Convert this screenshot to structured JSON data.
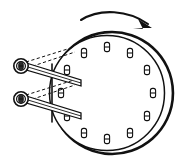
{
  "figure": {
    "title": "Rotating drum with bolted rim and twin pivoting link rods",
    "background_color": "#ffffff",
    "line_color": "#111111",
    "width": 175,
    "height": 162
  },
  "rotation_arrow": {
    "name": "rotation-direction-arrow",
    "direction": "clockwise",
    "label": "",
    "position": "above drum, sweeping left to right"
  },
  "drum": {
    "name": "drum-wheel",
    "center_x": 107,
    "center_y": 93,
    "radius": 61,
    "rim_thickness": 4,
    "bolt_count": 12,
    "bolt_circle_radius": 46,
    "bolt_label": "",
    "bolts": [
      {
        "index": 1,
        "angle_deg": 270,
        "x": 107,
        "y": 47
      },
      {
        "index": 2,
        "angle_deg": 300,
        "x": 130,
        "y": 53
      },
      {
        "index": 3,
        "angle_deg": 330,
        "x": 147,
        "y": 70
      },
      {
        "index": 4,
        "angle_deg": 0,
        "x": 153,
        "y": 93
      },
      {
        "index": 5,
        "angle_deg": 30,
        "x": 147,
        "y": 116
      },
      {
        "index": 6,
        "angle_deg": 60,
        "x": 130,
        "y": 133
      },
      {
        "index": 7,
        "angle_deg": 90,
        "x": 107,
        "y": 139
      },
      {
        "index": 8,
        "angle_deg": 120,
        "x": 84,
        "y": 133
      },
      {
        "index": 9,
        "angle_deg": 150,
        "x": 67,
        "y": 116
      },
      {
        "index": 10,
        "angle_deg": 180,
        "x": 61,
        "y": 93
      },
      {
        "index": 11,
        "angle_deg": 210,
        "x": 67,
        "y": 70
      },
      {
        "index": 12,
        "angle_deg": 240,
        "x": 84,
        "y": 53
      }
    ]
  },
  "linkage": {
    "name": "twin-link-assembly",
    "rod_count": 2,
    "rods": [
      {
        "index": 1,
        "name": "upper-link-rod",
        "pivot_x": 21,
        "pivot_y": 66,
        "pivot_radius": 7,
        "tip_x": 80,
        "tip_y": 84,
        "ghost_tip_x": 72,
        "ghost_tip_y": 50,
        "label": ""
      },
      {
        "index": 2,
        "name": "lower-link-rod",
        "pivot_x": 21,
        "pivot_y": 99,
        "pivot_radius": 7,
        "tip_x": 80,
        "tip_y": 117,
        "ghost_tip_x": 72,
        "ghost_tip_y": 83,
        "label": ""
      }
    ],
    "ghost_line_style": "dashed",
    "ghost_meaning": "alternate rod position"
  },
  "annotations": {
    "visible_text": [],
    "caption": ""
  }
}
